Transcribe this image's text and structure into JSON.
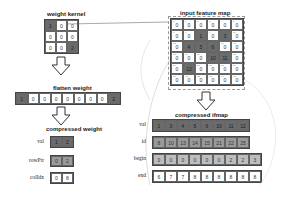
{
  "weight_kernel": {
    "title": "weight kernel",
    "cells": [
      [
        "1",
        "0",
        "0"
      ],
      [
        "0",
        "0",
        "0"
      ],
      [
        "0",
        "0",
        "2"
      ]
    ]
  },
  "flatten_weight": {
    "title": "flatten weight",
    "cells": [
      "1",
      "0",
      "0",
      "0",
      "0",
      "0",
      "0",
      "0",
      "2"
    ]
  },
  "compressed_weight": {
    "title": "compressed weight",
    "rows": [
      {
        "label": "val",
        "cells": [
          "1",
          "2"
        ]
      },
      {
        "label": "rowPtr",
        "cells": [
          "0",
          "2"
        ]
      },
      {
        "label": "colIdx",
        "cells": [
          "0",
          "8"
        ]
      }
    ]
  },
  "input_feature_map": {
    "title": "input feature map",
    "cells": [
      [
        "0",
        "0",
        "0",
        "0",
        "0",
        "0"
      ],
      [
        "0",
        "0",
        "1",
        "0",
        "3",
        "0"
      ],
      [
        "0",
        "4",
        "5",
        "6",
        "0",
        "0"
      ],
      [
        "0",
        "0",
        "0",
        "10",
        "11",
        "0"
      ],
      [
        "0",
        "12",
        "0",
        "0",
        "0",
        "0"
      ],
      [
        "0",
        "0",
        "0",
        "0",
        "0",
        "0"
      ]
    ],
    "highlight": [
      [
        1,
        2
      ],
      [
        1,
        4
      ],
      [
        2,
        1
      ],
      [
        2,
        2
      ],
      [
        2,
        3
      ],
      [
        3,
        3
      ],
      [
        3,
        4
      ],
      [
        4,
        1
      ]
    ]
  },
  "compressed_ifmap": {
    "title": "compressed ifmap",
    "rows": [
      {
        "label": "val",
        "cells": [
          "1",
          "3",
          "4",
          "5",
          "6",
          "10",
          "11",
          "12"
        ]
      },
      {
        "label": "id",
        "cells": [
          "8",
          "10",
          "13",
          "14",
          "15",
          "21",
          "22",
          "25"
        ]
      },
      {
        "label": "begin",
        "cells": [
          "0",
          "0",
          "0",
          "0",
          "0",
          "0",
          "2",
          "2",
          "3"
        ]
      },
      {
        "label": "end",
        "cells": [
          "6",
          "7",
          "7",
          "8",
          "8",
          "8",
          "8",
          "8",
          "8"
        ]
      }
    ]
  }
}
